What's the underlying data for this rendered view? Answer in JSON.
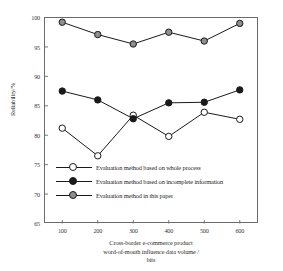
{
  "chart_data": {
    "type": "line",
    "title": "",
    "xlabel": "Cross-border e-commerce product word-of-mouth influence data volume / bits",
    "xlabel_lines": [
      "Cross-border e-commerce product",
      "word-of-mouth influence data volume /",
      "bits"
    ],
    "ylabel": "Reliability/%",
    "x": [
      100,
      200,
      300,
      400,
      500,
      600
    ],
    "xtick_labels": [
      "100",
      "200",
      "300",
      "400",
      "500",
      "600"
    ],
    "ytick_labels": [
      "100",
      "95",
      "90",
      "85",
      "80",
      "75",
      "70",
      "65"
    ],
    "yticks": [
      100,
      95,
      90,
      85,
      80,
      75,
      70,
      65
    ],
    "xlim": [
      50,
      650
    ],
    "ylim": [
      65,
      100
    ],
    "grid": false,
    "legend_position": "inside-lower-left",
    "series": [
      {
        "name": "Evaluation method based on whole process",
        "marker": "open-circle",
        "marker_fill": "#ffffff",
        "line_color": "#1a1a1a",
        "values": [
          81.2,
          76.5,
          83.4,
          79.8,
          83.9,
          82.7
        ]
      },
      {
        "name": "Evaluation method based on incomplete information",
        "marker": "filled-circle",
        "marker_fill": "#1a1a1a",
        "line_color": "#1a1a1a",
        "values": [
          87.5,
          86.0,
          82.8,
          85.5,
          85.6,
          87.7
        ]
      },
      {
        "name": "Evaluation method in this paper",
        "marker": "gray-circle",
        "marker_fill": "#8e8e8e",
        "line_color": "#1a1a1a",
        "values": [
          99.2,
          97.1,
          95.5,
          97.5,
          96.0,
          99.0
        ]
      }
    ],
    "colors": {
      "axis": "#6b6b6b",
      "line": "#1a1a1a",
      "marker_open": "#ffffff",
      "marker_solid": "#1a1a1a",
      "marker_gray": "#8e8e8e",
      "background": "#ffffff"
    }
  },
  "legend": {
    "items": [
      {
        "label": "Evaluation method based on whole process"
      },
      {
        "label": "Evaluation method based on incomplete information"
      },
      {
        "label": "Evaluation method in this paper"
      }
    ]
  }
}
